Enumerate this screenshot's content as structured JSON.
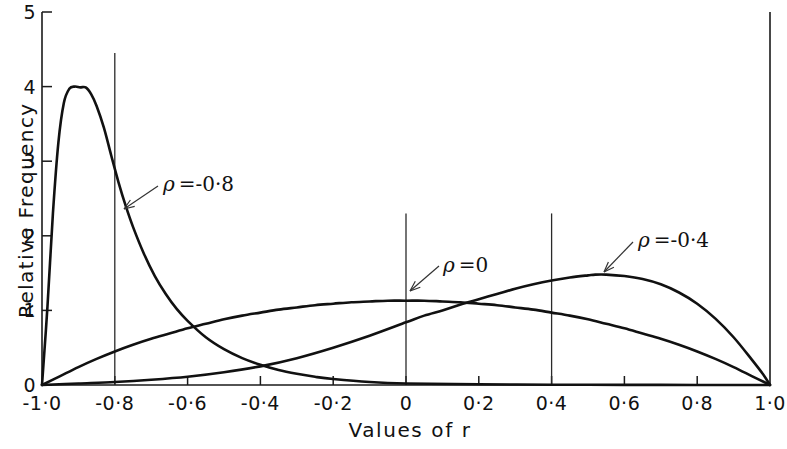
{
  "chart_data": {
    "type": "line",
    "title": "",
    "xlabel": "Values of r",
    "ylabel": "Relative Frequency",
    "xlim": [
      -1.0,
      1.0
    ],
    "ylim": [
      0,
      5
    ],
    "grid": false,
    "legend_position": "inline-annotations",
    "x_tick_labels": [
      "-1·0",
      "-0·8",
      "-0·6",
      "-0·4",
      "-0·2",
      "0",
      "0·2",
      "0·4",
      "0·6",
      "0·8",
      "1·0"
    ],
    "x_tick_values": [
      -1.0,
      -0.8,
      -0.6,
      -0.4,
      -0.2,
      0,
      0.2,
      0.4,
      0.6,
      0.8,
      1.0
    ],
    "y_tick_labels": [
      "0",
      "1",
      "2",
      "3",
      "4",
      "5"
    ],
    "y_tick_values": [
      0,
      1,
      2,
      3,
      4,
      5
    ],
    "reference_lines": [
      {
        "name": "rho-minus-0-8-line",
        "x": -0.8,
        "y_top": 4.45
      },
      {
        "name": "rho-0-line",
        "x": 0.0,
        "y_top": 2.3
      },
      {
        "name": "rho-plus-0-4-line",
        "x": 0.4,
        "y_top": 2.3
      }
    ],
    "annotations": [
      {
        "name": "rho-minus-0-8",
        "symbol": "ρ",
        "text": "=-0·8",
        "label_x_px": 163,
        "label_y_px": 172,
        "arrow_from_px": [
          158,
          186
        ],
        "arrow_to_px": [
          124,
          209
        ]
      },
      {
        "name": "rho-0",
        "symbol": "ρ",
        "text": "=0",
        "label_x_px": 443,
        "label_y_px": 253,
        "arrow_from_px": [
          439,
          266
        ],
        "arrow_to_px": [
          410,
          291
        ]
      },
      {
        "name": "rho-plus-0-4",
        "symbol": "ρ",
        "text": "=-0·4",
        "label_x_px": 638,
        "label_y_px": 228,
        "arrow_from_px": [
          633,
          242
        ],
        "arrow_to_px": [
          604,
          272
        ]
      }
    ],
    "series": [
      {
        "name": "ρ = -0·8",
        "peak_x": -0.88,
        "peak_y": 4.0,
        "x": [
          -1.0,
          -0.985,
          -0.97,
          -0.955,
          -0.94,
          -0.925,
          -0.91,
          -0.895,
          -0.88,
          -0.865,
          -0.85,
          -0.83,
          -0.81,
          -0.79,
          -0.77,
          -0.75,
          -0.72,
          -0.69,
          -0.66,
          -0.63,
          -0.6,
          -0.55,
          -0.5,
          -0.45,
          -0.4,
          -0.35,
          -0.3,
          -0.25,
          -0.2,
          -0.1,
          0.0,
          0.2,
          0.4,
          0.6,
          0.8,
          1.0
        ],
        "y": [
          0.0,
          1.05,
          2.3,
          3.25,
          3.78,
          3.97,
          4.0,
          3.99,
          3.99,
          3.9,
          3.74,
          3.45,
          3.08,
          2.72,
          2.4,
          2.12,
          1.76,
          1.46,
          1.22,
          1.02,
          0.86,
          0.64,
          0.48,
          0.36,
          0.27,
          0.2,
          0.15,
          0.11,
          0.08,
          0.04,
          0.02,
          0.01,
          0.004,
          0.002,
          0.001,
          0.0
        ]
      },
      {
        "name": "ρ = 0",
        "peak_x": 0.0,
        "peak_y": 1.13,
        "x": [
          -1.0,
          -0.95,
          -0.9,
          -0.85,
          -0.8,
          -0.75,
          -0.7,
          -0.65,
          -0.6,
          -0.55,
          -0.5,
          -0.45,
          -0.4,
          -0.35,
          -0.3,
          -0.25,
          -0.2,
          -0.15,
          -0.1,
          -0.05,
          0.0,
          0.05,
          0.1,
          0.15,
          0.2,
          0.25,
          0.3,
          0.35,
          0.4,
          0.45,
          0.5,
          0.55,
          0.6,
          0.65,
          0.7,
          0.75,
          0.8,
          0.85,
          0.9,
          0.95,
          1.0
        ],
        "y": [
          0.0,
          0.12,
          0.24,
          0.35,
          0.45,
          0.54,
          0.62,
          0.69,
          0.76,
          0.82,
          0.88,
          0.93,
          0.97,
          1.01,
          1.04,
          1.07,
          1.09,
          1.11,
          1.12,
          1.13,
          1.13,
          1.13,
          1.12,
          1.11,
          1.09,
          1.07,
          1.04,
          1.01,
          0.97,
          0.93,
          0.88,
          0.82,
          0.76,
          0.69,
          0.62,
          0.54,
          0.45,
          0.35,
          0.24,
          0.12,
          0.0
        ]
      },
      {
        "name": "ρ = 0·4",
        "peak_x": 0.52,
        "peak_y": 1.48,
        "x": [
          -1.0,
          -0.9,
          -0.8,
          -0.7,
          -0.6,
          -0.5,
          -0.4,
          -0.3,
          -0.2,
          -0.1,
          0.0,
          0.05,
          0.1,
          0.15,
          0.2,
          0.25,
          0.3,
          0.35,
          0.4,
          0.45,
          0.5,
          0.52,
          0.55,
          0.6,
          0.65,
          0.7,
          0.75,
          0.8,
          0.85,
          0.9,
          0.95,
          0.98,
          1.0
        ],
        "y": [
          0.0,
          0.02,
          0.04,
          0.07,
          0.11,
          0.17,
          0.25,
          0.36,
          0.5,
          0.66,
          0.84,
          0.93,
          1.0,
          1.08,
          1.15,
          1.22,
          1.29,
          1.35,
          1.4,
          1.44,
          1.47,
          1.48,
          1.48,
          1.46,
          1.42,
          1.35,
          1.24,
          1.09,
          0.89,
          0.64,
          0.34,
          0.15,
          0.0
        ]
      }
    ]
  },
  "axes": {
    "y_title": "Relative Frequency",
    "x_title": "Values of r"
  }
}
